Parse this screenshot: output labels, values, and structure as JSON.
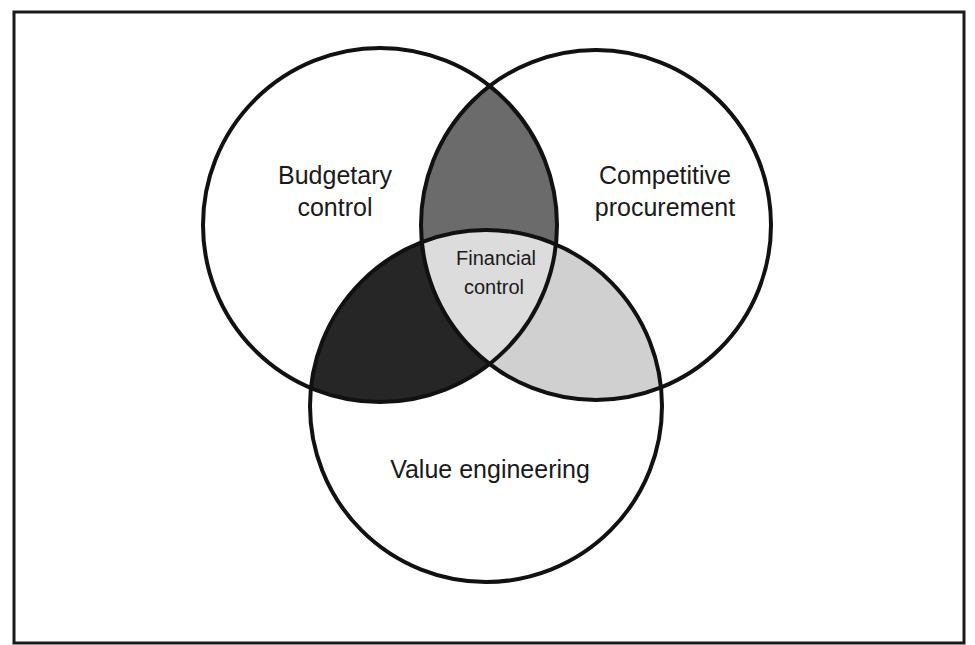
{
  "diagram": {
    "type": "venn",
    "frame": {
      "x": 14,
      "y": 12,
      "width": 950,
      "height": 631,
      "stroke": "#1a1a1a"
    },
    "circles": [
      {
        "id": "budgetary",
        "label_lines": [
          "Budgetary",
          "control"
        ],
        "cx": 380,
        "cy": 225,
        "r": 177
      },
      {
        "id": "competitive",
        "label_lines": [
          "Competitive",
          "procurement"
        ],
        "cx": 596,
        "cy": 225,
        "r": 175
      },
      {
        "id": "value",
        "label_lines": [
          "Value engineering"
        ],
        "cx": 486,
        "cy": 406,
        "r": 176
      }
    ],
    "intersections": {
      "budgetary_competitive": {
        "color": "#6b6b6b"
      },
      "budgetary_value": {
        "color": "#262626"
      },
      "competitive_value": {
        "color": "#d0d0d0"
      },
      "all_three": {
        "color": "#dcdcdc",
        "label_lines": [
          "Financial",
          "control"
        ]
      }
    },
    "labels": {
      "budgetary_line1": "Budgetary",
      "budgetary_line2": "control",
      "competitive_line1": "Competitive",
      "competitive_line2": "procurement",
      "value": "Value engineering",
      "center_line1": "Financial",
      "center_line2": "control"
    },
    "stroke_color": "#111111"
  }
}
